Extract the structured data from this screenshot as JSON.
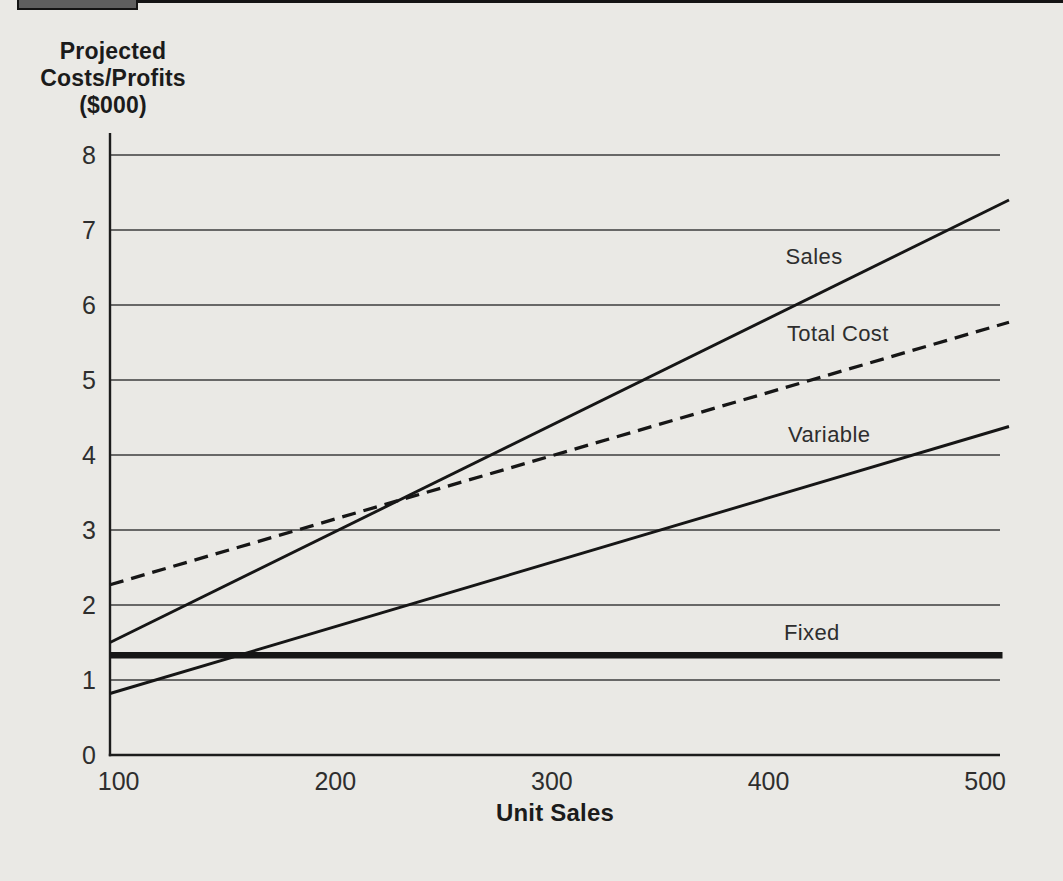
{
  "colors": {
    "page_background": "#eae9e5",
    "top_rule": "#141414",
    "tab_fill": "#5f5f5f",
    "grid": "#3d3d3d",
    "axis": "#1c1c1c",
    "line": "#161616",
    "text": "#2e2e2e",
    "text_strong": "#1b1b1b"
  },
  "chart_data": {
    "type": "line",
    "title": "",
    "xlabel": "Unit Sales",
    "ylabel_lines": [
      "Projected",
      "Costs/Profits",
      "($000)"
    ],
    "ylabel": "Projected Costs/Profits ($000)",
    "x_ticks": [
      100,
      200,
      300,
      400,
      500
    ],
    "y_ticks": [
      0,
      1,
      2,
      3,
      4,
      5,
      6,
      7,
      8
    ],
    "xlim": [
      96,
      511
    ],
    "ylim": [
      0,
      8
    ],
    "grid": "horizontal",
    "legend_position": "inline-labels",
    "series": [
      {
        "name": "Sales",
        "line_style": "solid",
        "thickness": "normal",
        "points": [
          [
            96,
            1.5
          ],
          [
            511,
            7.4
          ]
        ],
        "label": {
          "text": "Sales",
          "x": 421,
          "y": 6.64
        }
      },
      {
        "name": "Total Cost",
        "line_style": "dashed",
        "thickness": "normal",
        "points": [
          [
            96,
            2.27
          ],
          [
            511,
            5.77
          ]
        ],
        "label": {
          "text": "Total Cost",
          "x": 432,
          "y": 5.61
        }
      },
      {
        "name": "Variable",
        "line_style": "solid",
        "thickness": "normal",
        "points": [
          [
            96,
            0.82
          ],
          [
            511,
            4.38
          ]
        ],
        "label": {
          "text": "Variable",
          "x": 428,
          "y": 4.27
        }
      },
      {
        "name": "Fixed",
        "line_style": "solid",
        "thickness": "thick",
        "points": [
          [
            96,
            1.33
          ],
          [
            508,
            1.33
          ]
        ],
        "label": {
          "text": "Fixed",
          "x": 420,
          "y": 1.63
        }
      }
    ]
  }
}
